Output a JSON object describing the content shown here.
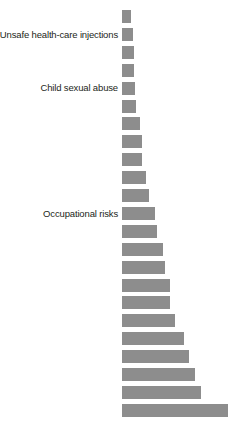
{
  "chart_data": {
    "type": "bar",
    "orientation": "horizontal",
    "title": "",
    "subtitle": "",
    "xlabel": "",
    "ylabel": "",
    "grid": false,
    "legend": null,
    "axis_visible": false,
    "tick_labels": [],
    "xlim": [
      0,
      106
    ],
    "bar_color": "#8d8d8d",
    "background_color": "#ffffff",
    "label_color": "#231f20",
    "categories": [
      "",
      "Unsafe health-care injections",
      "",
      "",
      "Child sexual abuse",
      "",
      "",
      "",
      "",
      "",
      "",
      "Occupational risks",
      "",
      "",
      "",
      "",
      "",
      "",
      "",
      "",
      "",
      "",
      ""
    ],
    "values": [
      9,
      11,
      12,
      12,
      13,
      14,
      18,
      20,
      20,
      24,
      27,
      33,
      35,
      41,
      43,
      48,
      48,
      53,
      62,
      67,
      73,
      79,
      106
    ],
    "labeled_bars": [
      {
        "index": 1,
        "label": "Unsafe health-care injections",
        "value": 11
      },
      {
        "index": 4,
        "label": "Child sexual abuse",
        "value": 13
      },
      {
        "index": 11,
        "label": "Occupational risks",
        "value": 33
      }
    ],
    "bar_count": 23
  },
  "layout": {
    "bar_left_px": 122,
    "bar_height_px": 13,
    "bar_pitch_px": 17.9,
    "first_bar_top_px": 10,
    "value_to_px": 1.0
  }
}
